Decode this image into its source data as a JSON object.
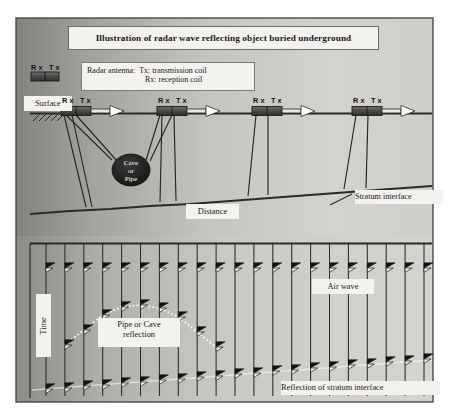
{
  "figure": {
    "title": "Illustration of radar wave reflecting object buried underground",
    "background": {
      "frame_border": "#3c3c3c",
      "gradient_dark": "#8a8a86",
      "gradient_light": "#d8d7d2",
      "page": "#ffffff"
    }
  },
  "legend": {
    "heading": "Radar antenna:",
    "tx_line": "Tx: transmission coil",
    "rx_line": "Rx: reception coil",
    "antenna_tag": "Rx Tx"
  },
  "upper_panel": {
    "surface_label": "Surface",
    "distance_label": "Distance",
    "stratum_label": "Stratum interface",
    "buried_object": {
      "line1": "Cave",
      "line2": "or",
      "line3": "Pipe"
    },
    "antenna_tags": [
      "Rx Tx",
      "Rx Tx",
      "Rx Tx",
      "Rx Tx"
    ],
    "antenna_positions_x": [
      68,
      165,
      260,
      360
    ],
    "surface_y": 113,
    "object_center": {
      "x": 131,
      "y": 170
    },
    "object_rx": 19,
    "object_ry": 16
  },
  "lower_panel": {
    "time_label": "Time",
    "air_wave_label": "Air wave",
    "pipe_cave_label": {
      "line1": "Pipe or Cave",
      "line2": "reflection"
    },
    "stratum_reflection_label": "Reflection of stratum interface",
    "trace_count": 21,
    "top_axis_y": 243,
    "airwave_y": 268,
    "hyperbola_apex": {
      "x": 131,
      "y": 305
    },
    "stratum_reflection": {
      "left_y": 388,
      "right_y": 358
    }
  },
  "chart_data": {
    "type": "line",
    "title": "Illustration of radar wave reflecting object buried underground",
    "xlabel": "Distance",
    "ylabel": "Time",
    "annotations": [
      "Surface",
      "Stratum interface",
      "Cave or Pipe",
      "Air wave",
      "Pipe or Cave reflection",
      "Reflection of stratum interface"
    ],
    "series": [
      {
        "name": "Air wave",
        "x": [
          0,
          1,
          2,
          3,
          4,
          5,
          6,
          7,
          8,
          9,
          10,
          11,
          12,
          13,
          14,
          15,
          16,
          17,
          18,
          19,
          20
        ],
        "values": [
          268,
          268,
          268,
          268,
          268,
          268,
          268,
          268,
          268,
          268,
          268,
          268,
          268,
          268,
          268,
          268,
          268,
          268,
          268,
          268,
          268
        ]
      },
      {
        "name": "Pipe or Cave reflection",
        "x": [
          1,
          2,
          3,
          4,
          5,
          6,
          7,
          8,
          9
        ],
        "values": [
          345,
          330,
          315,
          307,
          305,
          308,
          317,
          332,
          347
        ]
      },
      {
        "name": "Reflection of stratum interface",
        "x": [
          0,
          1,
          2,
          3,
          4,
          5,
          6,
          7,
          8,
          9,
          10,
          11,
          12,
          13,
          14,
          15,
          16,
          17,
          18,
          19,
          20
        ],
        "values": [
          389,
          388,
          386,
          385,
          383,
          382,
          380,
          379,
          377,
          376,
          374,
          373,
          371,
          370,
          368,
          367,
          365,
          364,
          362,
          361,
          359
        ]
      }
    ],
    "grid": false,
    "legend_position": "inline-annotations"
  }
}
